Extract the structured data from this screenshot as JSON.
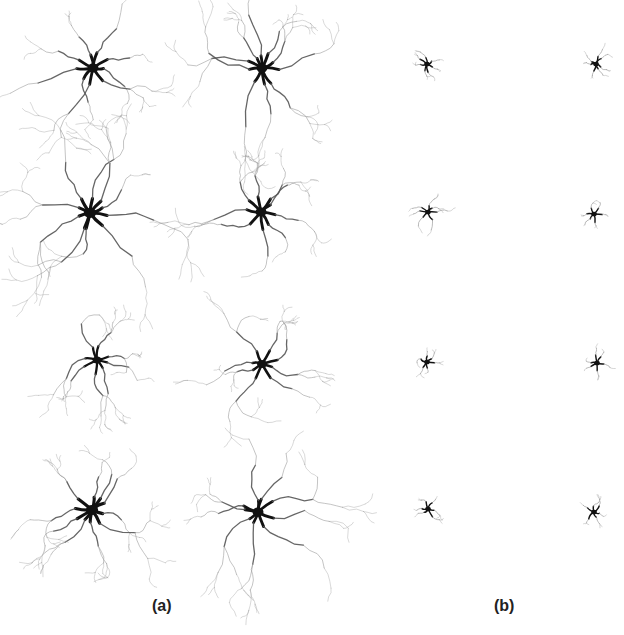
{
  "figure": {
    "panels": [
      {
        "label": "(a)",
        "label_x": 163,
        "label_y": 597,
        "description": "large ramified cell morphologies",
        "cells": [
          {
            "cx": 93,
            "cy": 68,
            "spread": 42,
            "soma": 10,
            "seed": 1,
            "branches": 9
          },
          {
            "cx": 262,
            "cy": 68,
            "spread": 48,
            "soma": 10,
            "seed": 2,
            "branches": 10
          },
          {
            "cx": 90,
            "cy": 213,
            "spread": 50,
            "soma": 11,
            "seed": 3,
            "branches": 10
          },
          {
            "cx": 261,
            "cy": 212,
            "spread": 40,
            "soma": 10,
            "seed": 4,
            "branches": 9
          },
          {
            "cx": 97,
            "cy": 360,
            "spread": 30,
            "soma": 8,
            "seed": 5,
            "branches": 8
          },
          {
            "cx": 262,
            "cy": 364,
            "spread": 32,
            "soma": 9,
            "seed": 6,
            "branches": 8
          },
          {
            "cx": 92,
            "cy": 510,
            "spread": 40,
            "soma": 11,
            "seed": 7,
            "branches": 10
          },
          {
            "cx": 258,
            "cy": 512,
            "spread": 48,
            "soma": 10,
            "seed": 8,
            "branches": 9
          }
        ]
      },
      {
        "label": "(b)",
        "label_x": 505,
        "label_y": 597,
        "description": "small compact cell morphologies",
        "cells": [
          {
            "cx": 427,
            "cy": 64,
            "spread": 9,
            "soma": 5,
            "seed": 11,
            "branches": 7
          },
          {
            "cx": 596,
            "cy": 64,
            "spread": 9,
            "soma": 5,
            "seed": 12,
            "branches": 7
          },
          {
            "cx": 428,
            "cy": 212,
            "spread": 12,
            "soma": 5,
            "seed": 13,
            "branches": 7
          },
          {
            "cx": 594,
            "cy": 214,
            "spread": 7,
            "soma": 5,
            "seed": 14,
            "branches": 6
          },
          {
            "cx": 427,
            "cy": 362,
            "spread": 8,
            "soma": 5,
            "seed": 15,
            "branches": 6
          },
          {
            "cx": 597,
            "cy": 363,
            "spread": 9,
            "soma": 5,
            "seed": 16,
            "branches": 6
          },
          {
            "cx": 428,
            "cy": 509,
            "spread": 8,
            "soma": 5,
            "seed": 17,
            "branches": 6
          },
          {
            "cx": 594,
            "cy": 512,
            "spread": 8,
            "soma": 5,
            "seed": 18,
            "branches": 6
          }
        ]
      }
    ],
    "colors": {
      "soma": "#111111",
      "process": "#555555",
      "fine": "#9a9a9a",
      "background": "#ffffff"
    }
  }
}
